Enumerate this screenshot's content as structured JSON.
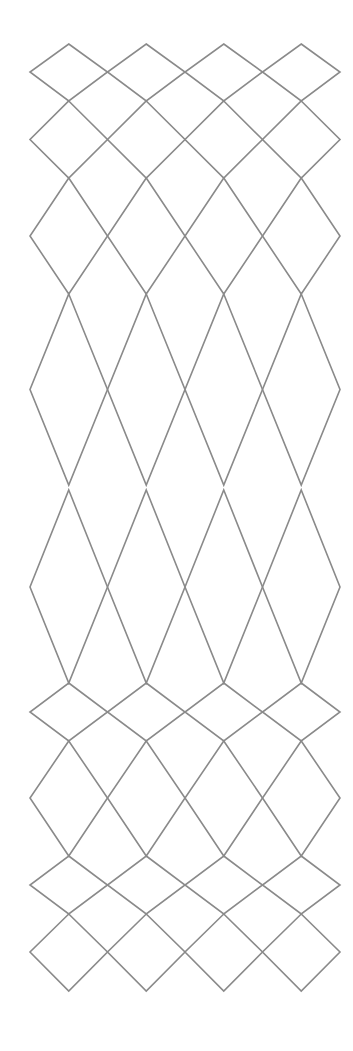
{
  "diagram": {
    "type": "diamond-lattice",
    "background": "#ffffff",
    "stroke_color": "#8a8a8a",
    "stroke_width": 1.6,
    "columns": {
      "count": 4,
      "left_edge": 30,
      "right_edge": 340
    },
    "rows": [
      {
        "top": 44,
        "mid": 72,
        "bottom": 101
      },
      {
        "top": 101,
        "mid": 139.5,
        "bottom": 178
      },
      {
        "top": 178,
        "mid": 236,
        "bottom": 294
      },
      {
        "top": 294,
        "mid": 389.5,
        "bottom": 485
      },
      {
        "top": 490,
        "mid": 587,
        "bottom": 683
      },
      {
        "top": 683,
        "mid": 712,
        "bottom": 741
      },
      {
        "top": 741,
        "mid": 798,
        "bottom": 856
      },
      {
        "top": 856,
        "mid": 885,
        "bottom": 914
      },
      {
        "top": 914,
        "mid": 952,
        "bottom": 991
      }
    ]
  }
}
